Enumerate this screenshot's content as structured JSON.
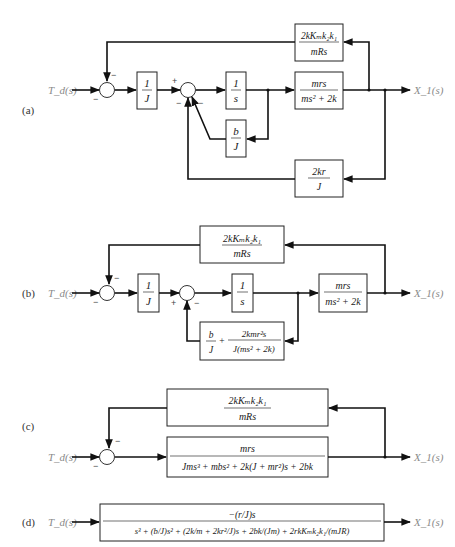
{
  "signals": {
    "input": "T_d(s)",
    "output": "X_1(s)"
  },
  "panels": {
    "a": {
      "label": "(a)",
      "blocks": {
        "inv_J": {
          "num": "1",
          "den": "J"
        },
        "integrator": {
          "num": "1",
          "den": "s"
        },
        "plant": {
          "num": "mrs",
          "den": "ms² + 2k"
        },
        "top_feedback": {
          "num": "2kKₘk₂k₁",
          "den": "mRs"
        },
        "damping": {
          "num": "b",
          "den": "J"
        },
        "bottom_feedback": {
          "num": "2kr",
          "den": "J"
        }
      },
      "signs": {
        "sum1_top": "−",
        "sum1_left": "−",
        "sum2_left": "+",
        "sum2_bl": "−",
        "sum2_br": "−"
      }
    },
    "b": {
      "label": "(b)",
      "blocks": {
        "inv_J": {
          "num": "1",
          "den": "J"
        },
        "integrator": {
          "num": "1",
          "den": "s"
        },
        "plant": {
          "num": "mrs",
          "den": "ms² + 2k"
        },
        "top_feedback": {
          "num": "2kKₘk₂k₁",
          "den": "mRs"
        },
        "inner_feedback": {
          "t1_num": "b",
          "t1_den": "J",
          "plus": "+",
          "t2_num": "2kmr²s",
          "t2_den": "J(ms² + 2k)"
        }
      },
      "signs": {
        "sum1_top": "−",
        "sum1_left": "−",
        "sum2_left": "+",
        "sum2_bottom": "−"
      }
    },
    "c": {
      "label": "(c)",
      "blocks": {
        "top_feedback": {
          "num": "2kKₘk₂k₁",
          "den": "mRs"
        },
        "forward": {
          "num": "mrs",
          "den": "Jms³ + mbs² + 2k(J + mr²)s + 2bk"
        }
      },
      "signs": {
        "sum_top": "−",
        "sum_left": "−"
      }
    },
    "d": {
      "label": "(d)",
      "blocks": {
        "closed_loop": {
          "num": "−(r/J)s",
          "den": "s³ + (b/J)s² + (2k/m + 2kr²/J)s + 2bk/(Jm) + 2rkKₘk₂k₁/(mJR)"
        }
      }
    }
  }
}
